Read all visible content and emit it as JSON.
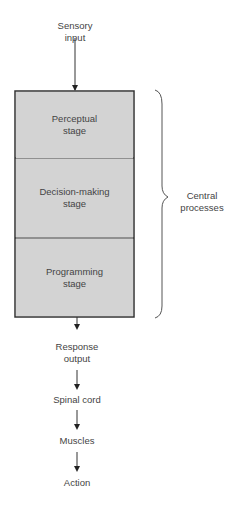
{
  "diagram": {
    "input": {
      "line1": "Sensory",
      "line2": "input"
    },
    "stages": [
      {
        "label": "Perceptual\nstage"
      },
      {
        "label": "Decision-making\nstage"
      },
      {
        "label": "Programming\nstage"
      }
    ],
    "brace_label": {
      "line1": "Central",
      "line2": "processes"
    },
    "outputs": [
      {
        "line1": "Response",
        "line2": "output"
      },
      {
        "line1": "Spinal cord",
        "line2": ""
      },
      {
        "line1": "Muscles",
        "line2": ""
      },
      {
        "line1": "Action",
        "line2": ""
      }
    ]
  }
}
